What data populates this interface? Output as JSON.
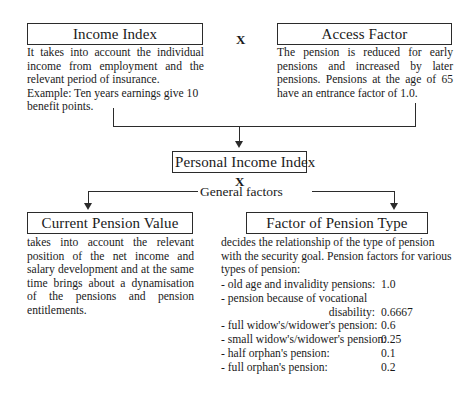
{
  "diagram": {
    "nodes": {
      "income_index": {
        "heading": "Income Index",
        "paragraphs": [
          "It takes into account the individual income from employment and the relevant period of insurance.",
          "Example: Ten years earnings give 10 benefit points."
        ]
      },
      "access_factor": {
        "heading": "Access Factor",
        "paragraphs": [
          "The pension is reduced for early pensions and increased by later pensions. Pensions at the age of 65 have an entrance factor of 1.0."
        ]
      },
      "personal_income_index": {
        "heading": "Personal Income Index"
      },
      "current_pension_value": {
        "heading": "Current Pension Value",
        "paragraphs": [
          "takes into account the relevant position of the net income and salary development and at the same time brings about a dynamisation of the pensions and pension entitlements."
        ]
      },
      "factor_of_pension_type": {
        "heading": "Factor of Pension Type",
        "intro": "decides the relationship of the type of pension with the security goal. Pension factors for various types of pension:",
        "factors": [
          {
            "label": "- old age and invalidity pensions:",
            "value": "1.0"
          },
          {
            "label": "- pension because of vocational",
            "value": ""
          },
          {
            "label": "disability:",
            "value": "0.6667",
            "indent": true
          },
          {
            "label": "- full widow's/widower's pension:",
            "value": "0.6"
          },
          {
            "label": "- small widow's/widower's pension:",
            "value": "0.25"
          },
          {
            "label": "- half orphan's pension:",
            "value": "0.1"
          },
          {
            "label": "- full orphan's pension:",
            "value": "0.2"
          }
        ]
      }
    },
    "operators": {
      "top_multiply": "X",
      "mid_multiply": "X"
    },
    "labels": {
      "general_factors": "General factors"
    },
    "colors": {
      "line": "#2b2b2b",
      "text": "#1a1a1a",
      "background": "#ffffff"
    }
  }
}
